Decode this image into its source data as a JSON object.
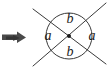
{
  "figure": {
    "background_color": "#ffffff",
    "stroke_color": "#3a3a3a",
    "label_color": "#1a1a1a",
    "arrow_color": "#4a4a4a",
    "width": 108,
    "height": 71
  },
  "pointer": {
    "name": "arrow",
    "direction": "right",
    "color": "#4a4a4a",
    "x": 2,
    "y": 36
  },
  "circle": {
    "center_x": 69,
    "center_y": 36,
    "radius": 23,
    "stroke_color": "#3a3a3a",
    "fill": "none"
  },
  "center_point": {
    "x": 69,
    "y": 36,
    "radius": 2,
    "color": "#1a1a1a"
  },
  "lines": [
    {
      "name": "line-1",
      "x1": 33,
      "y1": 9,
      "x2": 106,
      "y2": 64,
      "color": "#3a3a3a"
    },
    {
      "name": "line-2",
      "x1": 33,
      "y1": 66,
      "x2": 106,
      "y2": 3,
      "color": "#3a3a3a"
    }
  ],
  "labels": [
    {
      "id": "top",
      "text": "b",
      "x": 70,
      "y": 20
    },
    {
      "id": "bottom",
      "text": "b",
      "x": 70,
      "y": 53
    },
    {
      "id": "left",
      "text": "a",
      "x": 48,
      "y": 37
    },
    {
      "id": "right",
      "text": "a",
      "x": 92,
      "y": 37
    }
  ]
}
